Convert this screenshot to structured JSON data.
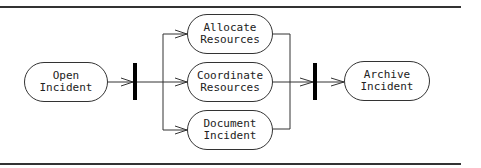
{
  "diagram": {
    "type": "uml-activity",
    "colors": {
      "stroke": "#333333",
      "bar": "#000000",
      "background": "#ffffff"
    },
    "nodes": [
      {
        "id": "open",
        "lines": [
          "Open",
          "Incident"
        ]
      },
      {
        "id": "allocate",
        "lines": [
          "Allocate",
          "Resources"
        ]
      },
      {
        "id": "coordinate",
        "lines": [
          "Coordinate",
          "Resources"
        ]
      },
      {
        "id": "document",
        "lines": [
          "Document",
          "Incident"
        ]
      },
      {
        "id": "archive",
        "lines": [
          "Archive",
          "Incident"
        ]
      }
    ],
    "bars": [
      {
        "id": "fork",
        "kind": "fork"
      },
      {
        "id": "join",
        "kind": "join"
      }
    ],
    "edges": [
      {
        "from": "open",
        "to": "fork"
      },
      {
        "from": "fork",
        "to": "allocate"
      },
      {
        "from": "fork",
        "to": "coordinate"
      },
      {
        "from": "fork",
        "to": "document"
      },
      {
        "from": "allocate",
        "to": "join"
      },
      {
        "from": "coordinate",
        "to": "join"
      },
      {
        "from": "document",
        "to": "join"
      },
      {
        "from": "join",
        "to": "archive"
      }
    ]
  }
}
